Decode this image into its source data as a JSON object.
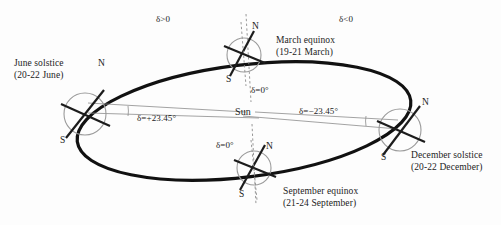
{
  "figure": {
    "background_color": "#fdfdfd",
    "ink_color": "#1c1c1c",
    "orbit_color": "#111111",
    "globe_outline_color": "#9a9a9a",
    "thin_line_color": "#8c8c8c"
  },
  "center": {
    "sun_label": "Sun"
  },
  "declination_regions": [
    {
      "name": "northern-declination-region",
      "label": "δ>0"
    },
    {
      "name": "southern-declination-region",
      "label": "δ<0"
    }
  ],
  "positions": [
    {
      "id": "june-solstice",
      "name": "June solstice",
      "dates": "(20-22 June)",
      "declination": "δ=+23.45°",
      "north_pole": "N",
      "south_pole": "S"
    },
    {
      "id": "march-equinox",
      "name": "March equinox",
      "dates": "(19-21 March)",
      "declination": "δ=0°",
      "north_pole": "N",
      "south_pole": "S"
    },
    {
      "id": "december-solstice",
      "name": "December solstice",
      "dates": "(20-22 December)",
      "declination": "δ=−23.45°",
      "north_pole": "N",
      "south_pole": "S"
    },
    {
      "id": "september-equinox",
      "name": "September equinox",
      "dates": "(21-24 September)",
      "declination": "δ=0°",
      "north_pole": "N",
      "south_pole": "S"
    }
  ]
}
